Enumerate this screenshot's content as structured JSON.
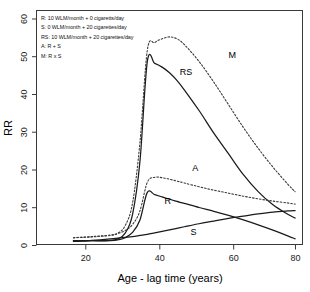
{
  "chart_data": {
    "type": "line",
    "title": "",
    "xlabel": "Age - lag time (years)",
    "ylabel": "RR",
    "xlim": [
      10,
      82
    ],
    "ylim": [
      0,
      62
    ],
    "xticks": [
      "20",
      "40",
      "60",
      "80"
    ],
    "xtick_values": [
      20,
      40,
      60,
      80
    ],
    "yticks": [
      "0",
      "10",
      "20",
      "30",
      "40",
      "50",
      "60"
    ],
    "ytick_values": [
      0,
      10,
      20,
      30,
      40,
      50,
      60
    ],
    "grid": false,
    "legend_position": "top-left",
    "x": [
      20,
      25,
      30,
      32,
      34,
      36,
      38,
      40,
      42,
      44,
      46,
      48,
      50,
      54,
      58,
      62,
      66,
      70,
      74,
      78,
      80
    ],
    "series": [
      {
        "name": "R",
        "label": "R",
        "style": "solid",
        "legend": "R: 10 WLM/month + 0 cigaretts/day",
        "values": [
          1.0,
          1.0,
          1.0,
          1.2,
          1.8,
          3.2,
          6.5,
          13.8,
          13.2,
          12.6,
          12.0,
          11.4,
          10.9,
          9.8,
          8.8,
          7.7,
          6.5,
          5.2,
          3.8,
          2.3,
          1.5
        ],
        "label_xy": [
          45.5,
          10.8
        ]
      },
      {
        "name": "S",
        "label": "S",
        "style": "solid",
        "legend": "S: 0 WLM/month + 20 cigarettes/day",
        "values": [
          0.8,
          1.1,
          1.5,
          1.7,
          1.9,
          2.1,
          2.4,
          2.7,
          3.1,
          3.5,
          3.9,
          4.3,
          4.7,
          5.5,
          6.2,
          6.9,
          7.5,
          8.1,
          8.6,
          8.9,
          9.0
        ],
        "label_xy": [
          52.5,
          2.6
        ]
      },
      {
        "name": "RS",
        "label": "RS",
        "style": "solid",
        "legend": "RS: 10 WLM/month + 20 cigarettes/day",
        "values": [
          1.0,
          1.0,
          1.1,
          1.5,
          3.0,
          8.0,
          22.0,
          48.5,
          48.0,
          47.0,
          45.5,
          43.5,
          41.0,
          35.5,
          29.5,
          24.0,
          18.5,
          14.0,
          10.5,
          8.0,
          7.0
        ],
        "label_xy": [
          50.5,
          45.0
        ]
      },
      {
        "name": "A",
        "label": "A",
        "style": "dotted",
        "legend": "A:  R + S",
        "values": [
          1.8,
          2.1,
          2.5,
          2.9,
          3.7,
          5.3,
          8.9,
          16.5,
          17.8,
          17.7,
          17.3,
          16.8,
          16.3,
          15.3,
          14.4,
          13.6,
          12.8,
          12.1,
          11.5,
          11.0,
          10.7
        ],
        "label_xy": [
          53.0,
          19.5
        ]
      },
      {
        "name": "M",
        "label": "M",
        "style": "dotted",
        "legend": "M:  R x S",
        "values": [
          1.8,
          2.0,
          2.4,
          3.0,
          5.0,
          11.0,
          27.0,
          51.5,
          53.5,
          54.5,
          55.0,
          54.5,
          53.0,
          48.5,
          43.0,
          37.0,
          31.0,
          25.5,
          20.5,
          16.0,
          14.0
        ],
        "label_xy": [
          63.0,
          49.5
        ]
      }
    ],
    "legend_lines": [
      "R: 10 WLM/month + 0 cigaretts/day",
      "S: 0 WLM/month + 20 cigarettes/day",
      "RS: 10 WLM/month + 20 cigarettes/day",
      "A:  R + S",
      "M:  R x S"
    ],
    "colors": {
      "solid": "#1a1a1a",
      "dotted": "#3a3a3a",
      "frame": "#3a3a3a",
      "background": "#ffffff"
    }
  }
}
